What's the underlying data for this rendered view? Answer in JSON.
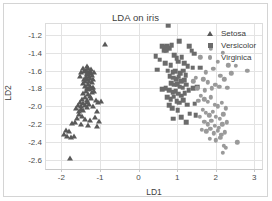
{
  "chart_data": {
    "type": "scatter",
    "title": "LDA on iris",
    "xlabel": "LD1",
    "ylabel": "LD2",
    "xlim": [
      -2.4,
      3.2
    ],
    "ylim": [
      -2.7,
      -1.08
    ],
    "xticks": [
      -2,
      -1,
      0,
      1,
      2,
      3
    ],
    "xtick_labels": [
      "-2",
      "-1",
      "0",
      "1",
      "2",
      "3"
    ],
    "yticks": [
      -1.2,
      -1.4,
      -1.6,
      -1.8,
      -2.0,
      -2.2,
      -2.4,
      -2.6
    ],
    "ytick_labels": [
      "-1.2",
      "-1.4",
      "-1.6",
      "-1.8",
      "-2.0",
      "-2.2",
      "-2.4",
      "-2.6"
    ],
    "grid": true,
    "legend_position": "top-right",
    "series": [
      {
        "name": "Setosa",
        "marker": "triangle",
        "color": "#595959",
        "points": [
          [
            -0.88,
            -1.3
          ],
          [
            -1.34,
            -1.55
          ],
          [
            -1.3,
            -1.57
          ],
          [
            -1.37,
            -1.59
          ],
          [
            -1.27,
            -1.6
          ],
          [
            -1.31,
            -1.62
          ],
          [
            -1.24,
            -1.63
          ],
          [
            -1.35,
            -1.64
          ],
          [
            -1.2,
            -1.65
          ],
          [
            -1.29,
            -1.66
          ],
          [
            -1.41,
            -1.6
          ],
          [
            -1.15,
            -1.62
          ],
          [
            -1.26,
            -1.68
          ],
          [
            -1.33,
            -1.7
          ],
          [
            -1.38,
            -1.72
          ],
          [
            -1.22,
            -1.73
          ],
          [
            -1.3,
            -1.75
          ],
          [
            -1.25,
            -1.77
          ],
          [
            -1.18,
            -1.78
          ],
          [
            -1.34,
            -1.79
          ],
          [
            -1.28,
            -1.81
          ],
          [
            -1.36,
            -1.83
          ],
          [
            -1.21,
            -1.84
          ],
          [
            -1.31,
            -1.86
          ],
          [
            -1.43,
            -1.85
          ],
          [
            -1.26,
            -1.88
          ],
          [
            -1.39,
            -1.9
          ],
          [
            -1.47,
            -1.92
          ],
          [
            -1.33,
            -1.93
          ],
          [
            -1.52,
            -1.95
          ],
          [
            -1.44,
            -1.96
          ],
          [
            -1.29,
            -1.97
          ],
          [
            -1.57,
            -1.98
          ],
          [
            -1.4,
            -1.99
          ],
          [
            -1.48,
            -2.0
          ],
          [
            -1.35,
            -2.01
          ],
          [
            -1.62,
            -2.02
          ],
          [
            -1.5,
            -2.03
          ],
          [
            -1.43,
            -2.04
          ],
          [
            -1.55,
            -2.05
          ],
          [
            -1.11,
            -1.93
          ],
          [
            -1.05,
            -1.95
          ],
          [
            -0.98,
            -1.94
          ],
          [
            -1.17,
            -2.0
          ],
          [
            -1.08,
            -2.05
          ],
          [
            -1.54,
            -2.09
          ],
          [
            -1.46,
            -2.11
          ],
          [
            -1.6,
            -2.13
          ],
          [
            -1.38,
            -2.14
          ],
          [
            -1.25,
            -2.15
          ],
          [
            -1.12,
            -2.12
          ],
          [
            -1.02,
            -2.16
          ],
          [
            -1.66,
            -2.18
          ],
          [
            -1.73,
            -2.19
          ],
          [
            -1.5,
            -2.2
          ],
          [
            -1.31,
            -2.21
          ],
          [
            -1.07,
            -2.22
          ],
          [
            -1.88,
            -2.26
          ],
          [
            -1.8,
            -2.27
          ],
          [
            -1.94,
            -2.31
          ],
          [
            -1.85,
            -2.33
          ],
          [
            -1.74,
            -2.34
          ],
          [
            -1.68,
            -2.33
          ],
          [
            -1.77,
            -2.58
          ],
          [
            -1.43,
            -1.57
          ],
          [
            -1.48,
            -1.62
          ],
          [
            -1.52,
            -1.66
          ],
          [
            -1.41,
            -1.69
          ],
          [
            -1.37,
            -1.67
          ],
          [
            -1.45,
            -1.74
          ],
          [
            -1.39,
            -1.77
          ],
          [
            -1.33,
            -1.63
          ],
          [
            -1.24,
            -1.58
          ],
          [
            -1.19,
            -1.7
          ],
          [
            -1.28,
            -1.72
          ],
          [
            -1.22,
            -1.8
          ],
          [
            -1.16,
            -1.83
          ],
          [
            -1.35,
            -1.95
          ],
          [
            -1.24,
            -1.91
          ]
        ]
      },
      {
        "name": "Versicolor",
        "marker": "square",
        "color": "#6b6b6b",
        "points": [
          [
            0.77,
            -1.1
          ],
          [
            0.62,
            -1.33
          ],
          [
            0.68,
            -1.34
          ],
          [
            0.74,
            -1.33
          ],
          [
            0.8,
            -1.35
          ],
          [
            0.66,
            -1.37
          ],
          [
            0.72,
            -1.38
          ],
          [
            0.86,
            -1.32
          ],
          [
            1.06,
            -1.27
          ],
          [
            1.31,
            -1.33
          ],
          [
            1.38,
            -1.38
          ],
          [
            1.44,
            -1.41
          ],
          [
            0.44,
            -1.44
          ],
          [
            0.55,
            -1.48
          ],
          [
            0.92,
            -1.43
          ],
          [
            0.99,
            -1.46
          ],
          [
            1.12,
            -1.45
          ],
          [
            0.48,
            -1.59
          ],
          [
            0.69,
            -1.52
          ],
          [
            0.83,
            -1.54
          ],
          [
            1.02,
            -1.5
          ],
          [
            1.19,
            -1.52
          ],
          [
            1.27,
            -1.55
          ],
          [
            1.4,
            -1.57
          ],
          [
            1.6,
            -1.57
          ],
          [
            0.76,
            -1.6
          ],
          [
            0.88,
            -1.62
          ],
          [
            0.95,
            -1.61
          ],
          [
            1.08,
            -1.63
          ],
          [
            1.15,
            -1.6
          ],
          [
            1.22,
            -1.65
          ],
          [
            0.81,
            -1.66
          ],
          [
            0.9,
            -1.68
          ],
          [
            0.97,
            -1.7
          ],
          [
            1.04,
            -1.67
          ],
          [
            1.11,
            -1.72
          ],
          [
            1.18,
            -1.71
          ],
          [
            0.85,
            -1.74
          ],
          [
            0.93,
            -1.76
          ],
          [
            1.0,
            -1.75
          ],
          [
            1.07,
            -1.78
          ],
          [
            1.14,
            -1.79
          ],
          [
            1.24,
            -1.76
          ],
          [
            0.7,
            -1.8
          ],
          [
            0.79,
            -1.82
          ],
          [
            0.88,
            -1.84
          ],
          [
            0.96,
            -1.83
          ],
          [
            1.03,
            -1.86
          ],
          [
            1.1,
            -1.88
          ],
          [
            1.2,
            -1.85
          ],
          [
            1.3,
            -1.82
          ],
          [
            1.42,
            -1.8
          ],
          [
            1.52,
            -1.78
          ],
          [
            0.62,
            -1.81
          ],
          [
            0.74,
            -1.9
          ],
          [
            0.83,
            -1.92
          ],
          [
            0.91,
            -1.89
          ],
          [
            0.99,
            -1.94
          ],
          [
            1.06,
            -1.96
          ],
          [
            1.16,
            -1.93
          ],
          [
            1.26,
            -1.98
          ],
          [
            1.45,
            -1.97
          ],
          [
            0.79,
            -1.99
          ],
          [
            0.87,
            -2.02
          ],
          [
            1.01,
            -2.04
          ],
          [
            1.33,
            -2.08
          ],
          [
            0.9,
            -2.14
          ],
          [
            1.11,
            -2.12
          ],
          [
            1.48,
            -2.1
          ],
          [
            1.23,
            -2.18
          ]
        ]
      },
      {
        "name": "Virginica",
        "marker": "circle",
        "color": "#9a9a9a",
        "points": [
          [
            2.82,
            -1.6
          ],
          [
            2.52,
            -1.55
          ],
          [
            2.19,
            -1.4
          ],
          [
            2.33,
            -1.54
          ],
          [
            2.05,
            -1.5
          ],
          [
            2.4,
            -1.63
          ],
          [
            2.12,
            -1.66
          ],
          [
            1.87,
            -1.36
          ],
          [
            1.94,
            -1.58
          ],
          [
            1.75,
            -1.62
          ],
          [
            1.68,
            -1.7
          ],
          [
            1.8,
            -1.73
          ],
          [
            1.99,
            -1.76
          ],
          [
            2.09,
            -1.78
          ],
          [
            1.9,
            -1.8
          ],
          [
            1.72,
            -1.82
          ],
          [
            2.22,
            -1.7
          ],
          [
            2.3,
            -1.79
          ],
          [
            1.62,
            -1.88
          ],
          [
            1.7,
            -1.92
          ],
          [
            1.79,
            -1.95
          ],
          [
            1.88,
            -1.9
          ],
          [
            1.97,
            -1.98
          ],
          [
            2.06,
            -2.0
          ],
          [
            2.15,
            -1.96
          ],
          [
            2.26,
            -2.02
          ],
          [
            1.55,
            -1.94
          ],
          [
            1.66,
            -2.04
          ],
          [
            1.74,
            -2.07
          ],
          [
            1.83,
            -2.1
          ],
          [
            1.92,
            -2.06
          ],
          [
            2.01,
            -2.12
          ],
          [
            2.11,
            -2.14
          ],
          [
            2.2,
            -2.09
          ],
          [
            1.59,
            -2.12
          ],
          [
            1.7,
            -2.17
          ],
          [
            1.8,
            -2.2
          ],
          [
            1.89,
            -2.16
          ],
          [
            1.98,
            -2.22
          ],
          [
            2.08,
            -2.24
          ],
          [
            2.17,
            -2.2
          ],
          [
            2.28,
            -2.18
          ],
          [
            1.64,
            -2.26
          ],
          [
            1.76,
            -2.28
          ],
          [
            1.86,
            -2.25
          ],
          [
            1.95,
            -2.3
          ],
          [
            2.05,
            -2.27
          ],
          [
            2.14,
            -2.32
          ],
          [
            2.24,
            -2.29
          ],
          [
            1.84,
            -2.36
          ],
          [
            2.01,
            -2.38
          ],
          [
            2.12,
            -2.35
          ],
          [
            2.56,
            -2.4
          ],
          [
            2.21,
            -2.44
          ],
          [
            2.26,
            -2.46
          ],
          [
            2.18,
            -2.52
          ],
          [
            1.42,
            -1.72
          ],
          [
            1.52,
            -1.8
          ],
          [
            1.6,
            -1.45
          ],
          [
            1.48,
            -1.68
          ]
        ]
      }
    ]
  },
  "legend": {
    "items": [
      {
        "label": "Setosa"
      },
      {
        "label": "Versicolor"
      },
      {
        "label": "Virginica"
      }
    ]
  }
}
